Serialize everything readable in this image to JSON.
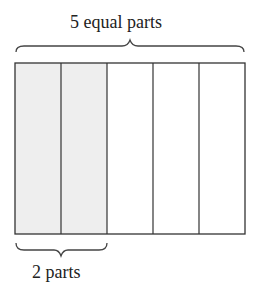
{
  "diagram": {
    "top_label": "5 equal parts",
    "bottom_label": "2 parts",
    "total_parts": 5,
    "shaded_parts": 2,
    "colors": {
      "shaded": "#eeeeee",
      "unshaded": "#ffffff",
      "stroke": "#333333"
    }
  }
}
